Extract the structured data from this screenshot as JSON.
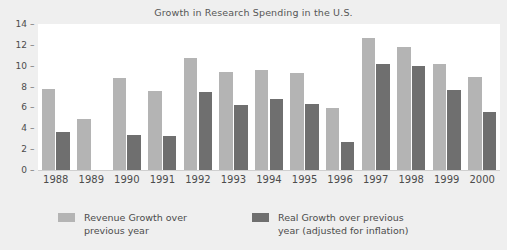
{
  "chart_data": {
    "type": "bar",
    "title": "Growth in Research Spending in the U.S.",
    "xlabel": "",
    "ylabel": "",
    "ylim": [
      0,
      14
    ],
    "yticks": [
      0,
      2,
      4,
      6,
      8,
      10,
      12,
      14
    ],
    "grid": false,
    "legend_position": "bottom",
    "categories": [
      "1988",
      "1989",
      "1990",
      "1991",
      "1992",
      "1993",
      "1994",
      "1995",
      "1996",
      "1997",
      "1998",
      "1999",
      "2000"
    ],
    "series": [
      {
        "name": "Revenue Growth over previous year",
        "color": "#b4b4b4",
        "values": [
          7.8,
          4.9,
          8.8,
          7.6,
          10.7,
          9.4,
          9.6,
          9.3,
          5.9,
          12.7,
          11.8,
          10.2,
          8.9
        ]
      },
      {
        "name": "Real Growth over previous year (adjusted for inflation)",
        "color": "#6f6f6f",
        "values": [
          3.6,
          null,
          3.4,
          3.3,
          7.5,
          6.2,
          6.8,
          6.3,
          2.7,
          10.2,
          10.0,
          7.7,
          5.6
        ]
      }
    ]
  },
  "legend": {
    "items": [
      {
        "label": "Revenue Growth over\nprevious year",
        "color": "#b4b4b4"
      },
      {
        "label": "Real Growth over previous\nyear (adjusted for inflation)",
        "color": "#6f6f6f"
      }
    ]
  },
  "colors": {
    "light_bar": "#b4b4b4",
    "dark_bar": "#6f6f6f",
    "plot_background": "#ffffff",
    "page_background": "#efefef",
    "text": "#4c4c4c"
  }
}
